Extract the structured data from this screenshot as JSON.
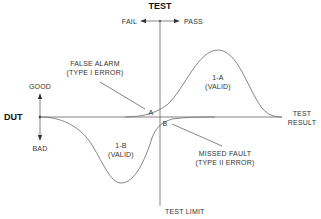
{
  "diagram": {
    "title": "TEST",
    "direction_labels": {
      "left": "FAIL",
      "right": "PASS"
    },
    "dut_axis": {
      "label": "DUT",
      "up": "GOOD",
      "down": "BAD"
    },
    "x_axis_label": [
      "TEST",
      "RESULT"
    ],
    "test_limit_label": "TEST LIMIT",
    "regions": {
      "valid_pass": [
        "1-A",
        "(VALID)"
      ],
      "valid_fail": [
        "1-B",
        "(VALID)"
      ]
    },
    "errors": {
      "false_alarm": [
        "FALSE ALARM",
        "(TYPE I ERROR)"
      ],
      "missed_fault": [
        "MISSED FAULT",
        "(TYPE II ERROR)"
      ]
    },
    "points": {
      "a": "A",
      "b": "B"
    },
    "colors": {
      "line": "#666666",
      "text": "#333333",
      "title": "#111111"
    }
  }
}
